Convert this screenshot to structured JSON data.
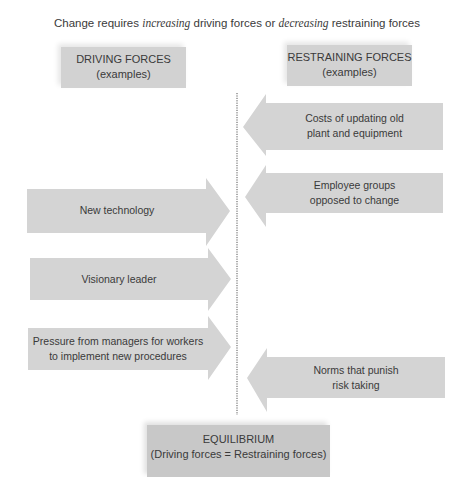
{
  "title": {
    "prefix": "Change requires ",
    "em1": "increasing",
    "middle": " driving forces or ",
    "em2": "decreasing",
    "suffix": " restraining forces"
  },
  "driving_header": {
    "line1": "DRIVING FORCES",
    "line2": "(examples)"
  },
  "restraining_header": {
    "line1": "RESTRAINING FORCES",
    "line2": "(examples)"
  },
  "driving_forces": [
    {
      "line1": "New technology",
      "line2": ""
    },
    {
      "line1": "Visionary leader",
      "line2": ""
    },
    {
      "line1": "Pressure from managers for workers",
      "line2": "to implement new procedures"
    }
  ],
  "restraining_forces": [
    {
      "line1": "Costs of updating old",
      "line2": "plant and equipment"
    },
    {
      "line1": "Employee groups",
      "line2": "opposed to change"
    },
    {
      "line1": "Norms that punish",
      "line2": "risk taking"
    }
  ],
  "equilibrium": {
    "line1": "EQUILIBRIUM",
    "line2": "(Driving forces = Restraining forces)"
  },
  "colors": {
    "arrow_fill": "#d4d4d4",
    "box_fill": "#d2d2d2",
    "equilibrium_fill": "#c8c8c8",
    "text": "#3a3a3a",
    "divider": "#555555"
  }
}
